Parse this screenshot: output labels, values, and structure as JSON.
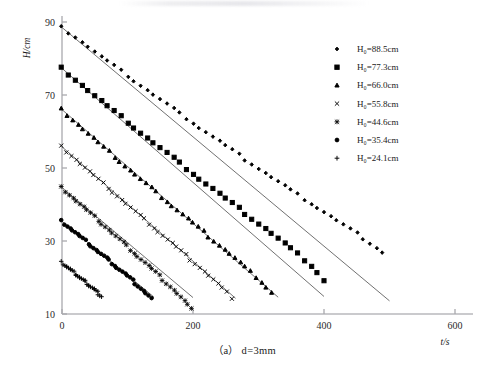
{
  "caption": {
    "prefix": "（a）",
    "symbol": "d",
    "equals": "=3mm",
    "full": "（a） d=3mm"
  },
  "axes": {
    "y_label": "H/cm",
    "x_label": "t/s",
    "x_ticks": [
      "0",
      "200",
      "400",
      "600"
    ],
    "y_ticks": [
      "10",
      "30",
      "50",
      "70",
      "90"
    ],
    "x_range": [
      0,
      600
    ],
    "y_range": [
      10,
      90
    ]
  },
  "legend": {
    "entries": [
      {
        "marker": "diamond-marker",
        "label": "H₀=88.5cm"
      },
      {
        "marker": "square-marker",
        "label": "H₀=77.3cm"
      },
      {
        "marker": "triangle-marker",
        "label": "H₀=66.0cm"
      },
      {
        "marker": "cross-marker",
        "label": "H₀=55.8cm"
      },
      {
        "marker": "asterisk-marker",
        "label": "H₀=44.6cm"
      },
      {
        "marker": "circle-marker",
        "label": "H₀=35.4cm"
      },
      {
        "marker": "plus-marker",
        "label": "H₀=24.1cm"
      }
    ]
  },
  "chart_data": {
    "type": "scatter",
    "title": "",
    "subtitle": "",
    "xlabel": "t/s",
    "ylabel": "H/cm",
    "xlim": [
      0,
      600
    ],
    "ylim": [
      10,
      90
    ],
    "xticks": [
      0,
      200,
      400,
      600
    ],
    "yticks": [
      10,
      30,
      50,
      70,
      90
    ],
    "grid": false,
    "legend_position": "upper-right-inside",
    "annotation": "（a） d=3mm",
    "series": [
      {
        "name": "H₀=88.5cm",
        "marker": "diamond",
        "color": "#000000",
        "H0": 88.5,
        "fit_line": {
          "x0": 0,
          "y0": 88.5,
          "x1": 500,
          "y1": 13.6
        },
        "x": [
          0,
          10,
          20,
          30,
          40,
          50,
          60,
          70,
          80,
          90,
          100,
          110,
          120,
          130,
          140,
          150,
          160,
          170,
          180,
          190,
          200,
          210,
          220,
          230,
          240,
          250,
          260,
          270,
          280,
          290,
          300,
          310,
          320,
          330,
          340,
          350,
          360,
          370,
          380,
          390,
          400,
          410,
          420,
          430,
          440,
          450,
          460,
          470,
          480,
          490
        ],
        "y": [
          88.5,
          87.2,
          86.0,
          84.6,
          83.3,
          81.9,
          80.5,
          79.3,
          78.0,
          76.6,
          75.3,
          74.0,
          72.7,
          71.4,
          70.1,
          68.8,
          67.5,
          66.2,
          64.9,
          63.7,
          62.4,
          61.1,
          59.9,
          58.6,
          57.4,
          56.1,
          54.9,
          53.6,
          52.4,
          51.2,
          49.9,
          48.7,
          47.5,
          46.3,
          45.1,
          43.9,
          42.7,
          41.5,
          40.3,
          39.2,
          38.0,
          36.8,
          35.6,
          34.4,
          33.2,
          32.0,
          30.8,
          29.5,
          28.2,
          26.9
        ]
      },
      {
        "name": "H₀=77.3cm",
        "marker": "square",
        "color": "#000000",
        "H0": 77.3,
        "fit_line": {
          "x0": 0,
          "y0": 77.3,
          "x1": 400,
          "y1": 14.8
        },
        "x": [
          0,
          10,
          20,
          30,
          40,
          50,
          60,
          70,
          80,
          90,
          100,
          110,
          120,
          130,
          140,
          150,
          160,
          170,
          180,
          190,
          200,
          210,
          220,
          230,
          240,
          250,
          260,
          270,
          280,
          290,
          300,
          310,
          320,
          330,
          340,
          350,
          360,
          370,
          380,
          390,
          400
        ],
        "y": [
          77.3,
          75.8,
          74.3,
          72.8,
          71.3,
          69.8,
          68.4,
          66.9,
          65.5,
          64.0,
          62.6,
          61.2,
          59.7,
          58.3,
          56.9,
          55.5,
          54.1,
          52.7,
          51.3,
          49.9,
          48.5,
          47.1,
          45.7,
          44.4,
          43.0,
          41.6,
          40.3,
          38.9,
          37.6,
          36.2,
          34.8,
          33.5,
          32.1,
          30.7,
          29.3,
          27.9,
          26.4,
          24.9,
          23.3,
          21.5,
          19.2
        ]
      },
      {
        "name": "H₀=66.0cm",
        "marker": "triangle",
        "color": "#000000",
        "H0": 66.0,
        "fit_line": {
          "x0": 0,
          "y0": 66.0,
          "x1": 330,
          "y1": 14.6
        },
        "x": [
          0,
          8,
          16,
          24,
          32,
          40,
          48,
          56,
          64,
          72,
          80,
          88,
          96,
          104,
          112,
          120,
          128,
          136,
          144,
          152,
          160,
          168,
          176,
          184,
          192,
          200,
          208,
          216,
          224,
          232,
          240,
          248,
          256,
          264,
          272,
          280,
          288,
          296,
          304,
          312,
          320
        ],
        "y": [
          66.0,
          64.6,
          63.3,
          62.0,
          60.7,
          59.4,
          58.2,
          56.9,
          55.6,
          54.4,
          53.1,
          51.9,
          50.6,
          49.4,
          48.2,
          46.9,
          45.7,
          44.5,
          43.3,
          42.1,
          40.9,
          39.7,
          38.5,
          37.3,
          36.1,
          34.9,
          33.7,
          32.5,
          31.3,
          30.1,
          28.9,
          27.7,
          26.5,
          25.3,
          24.0,
          22.8,
          21.5,
          20.2,
          18.8,
          17.4,
          15.9
        ]
      },
      {
        "name": "H₀=55.8cm",
        "marker": "cross",
        "color": "#000000",
        "H0": 55.8,
        "fit_line": {
          "x0": 0,
          "y0": 55.8,
          "x1": 265,
          "y1": 14.3
        },
        "x": [
          0,
          7,
          14,
          21,
          28,
          35,
          42,
          49,
          56,
          63,
          70,
          77,
          84,
          91,
          98,
          105,
          112,
          119,
          126,
          133,
          140,
          147,
          154,
          161,
          168,
          175,
          182,
          189,
          196,
          203,
          210,
          217,
          224,
          231,
          238,
          245,
          252,
          259
        ],
        "y": [
          55.8,
          54.6,
          53.5,
          52.4,
          51.2,
          50.1,
          49.0,
          47.9,
          46.8,
          45.7,
          44.6,
          43.5,
          42.4,
          41.3,
          40.2,
          39.1,
          38.0,
          36.9,
          35.9,
          34.8,
          33.7,
          32.6,
          31.5,
          30.4,
          29.4,
          28.3,
          27.2,
          26.1,
          25.0,
          23.9,
          22.8,
          21.7,
          20.5,
          19.4,
          18.2,
          17.0,
          15.8,
          14.5
        ]
      },
      {
        "name": "H₀=44.6cm",
        "marker": "asterisk",
        "color": "#000000",
        "H0": 44.6,
        "fit_line": {
          "x0": 0,
          "y0": 44.6,
          "x1": 200,
          "y1": 14.5
        },
        "x": [
          0,
          5.5,
          11,
          16.5,
          22,
          27.5,
          33,
          38.5,
          44,
          49.5,
          55,
          60.5,
          66,
          71.5,
          77,
          82.5,
          88,
          93.5,
          99,
          104.5,
          110,
          115.5,
          121,
          126.5,
          132,
          137.5,
          143,
          148.5,
          154,
          159.5,
          165,
          170.5,
          176,
          181.5,
          187,
          192.5,
          198
        ],
        "y": [
          44.6,
          43.7,
          42.8,
          41.9,
          41.0,
          40.1,
          39.3,
          38.4,
          37.5,
          36.6,
          35.7,
          34.8,
          34.0,
          33.1,
          32.2,
          31.3,
          30.4,
          29.5,
          28.6,
          27.7,
          26.8,
          25.9,
          25.0,
          24.1,
          23.2,
          22.3,
          21.4,
          20.4,
          19.5,
          18.5,
          17.6,
          16.6,
          15.6,
          14.6,
          13.5,
          12.4,
          11.2
        ]
      },
      {
        "name": "H₀=35.4cm",
        "marker": "circle",
        "color": "#000000",
        "H0": 35.4,
        "fit_line": {
          "x0": 0,
          "y0": 35.4,
          "x1": 140,
          "y1": 14.7
        },
        "x": [
          0,
          4,
          8,
          12,
          16,
          20,
          24,
          28,
          32,
          36,
          40,
          44,
          48,
          52,
          56,
          60,
          64,
          68,
          72,
          76,
          80,
          84,
          88,
          92,
          96,
          100,
          104,
          108,
          112,
          116,
          120,
          124,
          128,
          132,
          136
        ],
        "y": [
          35.4,
          34.8,
          34.2,
          33.6,
          33.0,
          32.4,
          31.8,
          31.2,
          30.6,
          30.0,
          29.4,
          28.8,
          28.2,
          27.6,
          27.0,
          26.4,
          25.8,
          25.2,
          24.6,
          24.0,
          23.4,
          22.8,
          22.2,
          21.6,
          21.0,
          20.4,
          19.8,
          19.1,
          18.5,
          17.8,
          17.1,
          16.4,
          15.7,
          15.0,
          14.2
        ]
      },
      {
        "name": "H₀=24.1cm",
        "marker": "plus",
        "color": "#000000",
        "H0": 24.1,
        "fit_line": {
          "x0": 0,
          "y0": 24.1,
          "x1": 62,
          "y1": 14.9
        },
        "x": [
          0,
          2,
          4,
          6,
          8,
          10,
          12,
          14,
          16,
          18,
          20,
          22,
          24,
          26,
          28,
          30,
          32,
          34,
          36,
          38,
          40,
          42,
          44,
          46,
          48,
          50,
          52,
          54,
          56,
          58,
          60
        ],
        "y": [
          24.1,
          23.8,
          23.5,
          23.2,
          22.9,
          22.6,
          22.3,
          22.0,
          21.7,
          21.4,
          21.1,
          20.8,
          20.5,
          20.2,
          19.9,
          19.6,
          19.3,
          19.0,
          18.7,
          18.4,
          18.1,
          17.8,
          17.5,
          17.2,
          16.9,
          16.6,
          16.2,
          15.9,
          15.6,
          15.2,
          14.9
        ]
      }
    ]
  }
}
